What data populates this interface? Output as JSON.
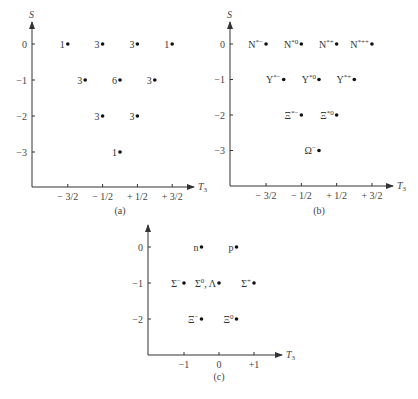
{
  "figure": {
    "panels": [
      {
        "id": "a",
        "caption": "(a)",
        "y_axis_label": "S",
        "x_axis_label": "T",
        "x_axis_subscript": "3",
        "x_ticks": [
          {
            "value": -1.5,
            "label": "− 3/2"
          },
          {
            "value": -0.5,
            "label": "− 1/2"
          },
          {
            "value": 0.5,
            "label": "+ 1/2"
          },
          {
            "value": 1.5,
            "label": "+ 3/2"
          }
        ],
        "y_ticks": [
          {
            "value": 0,
            "label": "0"
          },
          {
            "value": -1,
            "label": "−1"
          },
          {
            "value": -2,
            "label": "−2"
          },
          {
            "value": -3,
            "label": "−3"
          }
        ],
        "points": [
          {
            "t3": -1.5,
            "s": 0,
            "label": "1"
          },
          {
            "t3": -0.5,
            "s": 0,
            "label": "3"
          },
          {
            "t3": 0.5,
            "s": 0,
            "label": "3"
          },
          {
            "t3": 1.5,
            "s": 0,
            "label": "1"
          },
          {
            "t3": -1.0,
            "s": -1,
            "label": "3"
          },
          {
            "t3": 0.0,
            "s": -1,
            "label": "6"
          },
          {
            "t3": 1.0,
            "s": -1,
            "label": "3"
          },
          {
            "t3": -0.5,
            "s": -2,
            "label": "3"
          },
          {
            "t3": 0.5,
            "s": -2,
            "label": "3"
          },
          {
            "t3": 0.0,
            "s": -3,
            "label": "1"
          }
        ]
      },
      {
        "id": "b",
        "caption": "(b)",
        "y_axis_label": "S",
        "x_axis_label": "T",
        "x_axis_subscript": "3",
        "x_ticks": [
          {
            "value": -1.5,
            "label": "− 3/2"
          },
          {
            "value": -0.5,
            "label": "− 1/2"
          },
          {
            "value": 0.5,
            "label": "+ 1/2"
          },
          {
            "value": 1.5,
            "label": "+ 3/2"
          }
        ],
        "y_ticks": [
          {
            "value": 0,
            "label": "0"
          },
          {
            "value": -1,
            "label": "−1"
          },
          {
            "value": -2,
            "label": "−2"
          },
          {
            "value": -3,
            "label": "−3"
          }
        ],
        "points": [
          {
            "t3": -1.5,
            "s": 0,
            "label": "N*−"
          },
          {
            "t3": -0.5,
            "s": 0,
            "label": "N*0"
          },
          {
            "t3": 0.5,
            "s": 0,
            "label": "N*+"
          },
          {
            "t3": 1.5,
            "s": 0,
            "label": "N*++"
          },
          {
            "t3": -1.0,
            "s": -1,
            "label": "Y*−"
          },
          {
            "t3": 0.0,
            "s": -1,
            "label": "Y*0"
          },
          {
            "t3": 1.0,
            "s": -1,
            "label": "Y*+"
          },
          {
            "t3": -0.5,
            "s": -2,
            "label": "Ξ*−"
          },
          {
            "t3": 0.5,
            "s": -2,
            "label": "Ξ*0"
          },
          {
            "t3": 0.0,
            "s": -3,
            "label": "Ω−"
          }
        ]
      },
      {
        "id": "c",
        "caption": "(c)",
        "y_axis_label": "",
        "x_axis_label": "T",
        "x_axis_subscript": "3",
        "x_ticks": [
          {
            "value": -1,
            "label": "−1"
          },
          {
            "value": 0,
            "label": "0"
          },
          {
            "value": 1,
            "label": "+1"
          }
        ],
        "y_ticks": [
          {
            "value": 0,
            "label": "0"
          },
          {
            "value": -1,
            "label": "−1"
          },
          {
            "value": -2,
            "label": "−2"
          }
        ],
        "points": [
          {
            "t3": -0.5,
            "s": 0,
            "label": "n"
          },
          {
            "t3": 0.5,
            "s": 0,
            "label": "p"
          },
          {
            "t3": -1.0,
            "s": -1,
            "label": "Σ−"
          },
          {
            "t3": 0.0,
            "s": -1,
            "label": "Σ0, Λ"
          },
          {
            "t3": 1.0,
            "s": -1,
            "label": "Σ+"
          },
          {
            "t3": -0.5,
            "s": -2,
            "label": "Ξ−"
          },
          {
            "t3": 0.5,
            "s": -2,
            "label": "Ξ0"
          }
        ]
      }
    ]
  }
}
